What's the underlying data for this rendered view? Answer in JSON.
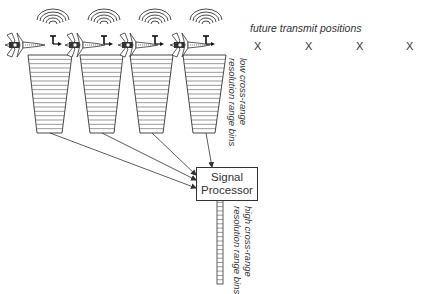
{
  "diagram": {
    "colors": {
      "line": "#333333",
      "bin_line": "#555555",
      "text": "#333333",
      "background": "#ffffff"
    },
    "future_positions": {
      "label": "future transmit positions",
      "marker": "X",
      "x_positions": [
        258,
        309,
        360,
        410
      ]
    },
    "aircraft": [
      {
        "id": "aircraft-1",
        "x": 3,
        "icon": "jet-aircraft-icon"
      },
      {
        "id": "aircraft-2",
        "x": 63,
        "icon": "jet-aircraft-icon"
      },
      {
        "id": "aircraft-3",
        "x": 116,
        "icon": "jet-aircraft-icon"
      },
      {
        "id": "aircraft-4",
        "x": 168,
        "icon": "jet-aircraft-icon"
      }
    ],
    "radar_waves": [
      {
        "cx": 53,
        "cy": 36
      },
      {
        "cx": 104,
        "cy": 36
      },
      {
        "cx": 155,
        "cy": 36
      },
      {
        "cx": 206,
        "cy": 36
      }
    ],
    "low_res_bins": {
      "label_line1": "low cross-range",
      "label_line2": "resolution range bins",
      "bin_count": 18,
      "trapezoids": [
        {
          "top_left": 28,
          "top_right": 72,
          "bottom_left": 37,
          "bottom_right": 62
        },
        {
          "top_left": 80,
          "top_right": 123,
          "bottom_left": 90,
          "bottom_right": 114
        },
        {
          "top_left": 130,
          "top_right": 173,
          "bottom_left": 140,
          "bottom_right": 163
        },
        {
          "top_left": 183,
          "top_right": 226,
          "bottom_left": 193,
          "bottom_right": 215
        }
      ],
      "top_y": 55,
      "bottom_y": 133
    },
    "processor": {
      "label_line1": "Signal",
      "label_line2": "Processor"
    },
    "arrows": [
      {
        "from": [
          50,
          133
        ],
        "to": [
          196,
          188
        ]
      },
      {
        "from": [
          102,
          133
        ],
        "to": [
          196,
          180
        ]
      },
      {
        "from": [
          152,
          133
        ],
        "to": [
          196,
          175
        ]
      },
      {
        "from": [
          206,
          133
        ],
        "to": [
          212,
          167
        ]
      }
    ],
    "high_res_bins": {
      "label_line1": "high cross-range",
      "label_line2": "resolution range bins",
      "bin_count": 20,
      "x": 217,
      "width": 6,
      "top_y": 198,
      "bottom_y": 284
    }
  }
}
